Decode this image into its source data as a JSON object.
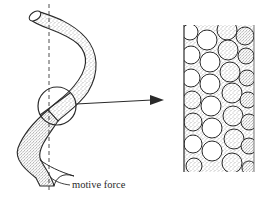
{
  "diagram": {
    "labels": {
      "motive_force": "motive force"
    },
    "colors": {
      "ink": "#2a2a2a",
      "stipple": "#555555",
      "background": "#ffffff"
    },
    "elements": {
      "tube": "twisted-tube",
      "axis": "dashed-vertical-axis",
      "magnifier": "magnifier-circle",
      "arrow": "right-arrow",
      "detail": "packed-spheres-column"
    }
  }
}
